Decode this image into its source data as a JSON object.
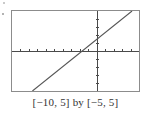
{
  "figure": {
    "caption": "[−10, 5] by [−5, 5]",
    "frame_color": "#8c8c8c",
    "axis_color": "#4a4a4a",
    "curve_color": "#555555",
    "background": "#ffffff"
  },
  "chart_data": {
    "type": "line",
    "title": "",
    "subtitle": "",
    "xlabel": "",
    "ylabel": "",
    "xlim": [
      -10,
      5
    ],
    "ylim": [
      -5,
      5
    ],
    "xtick_step": 1,
    "ytick_step": 1,
    "xticks": [
      -9,
      -8,
      -7,
      -6,
      -5,
      -4,
      -3,
      -2,
      -1,
      1,
      2,
      3,
      4,
      5
    ],
    "yticks": [
      -4,
      -3,
      -2,
      -1,
      1,
      2,
      3,
      4
    ],
    "grid": false,
    "legend": null,
    "axes_drawn": true,
    "tick_marks": true,
    "series": [
      {
        "name": "line",
        "slope": 0.85,
        "intercept": 1.45,
        "x_intercept": -1.7,
        "y_intercept": 1.45,
        "x": [
          -10,
          5
        ],
        "values": [
          -7.05,
          5.7
        ]
      }
    ],
    "annotations": [
      "[−10, 5] by [−5, 5]"
    ]
  }
}
